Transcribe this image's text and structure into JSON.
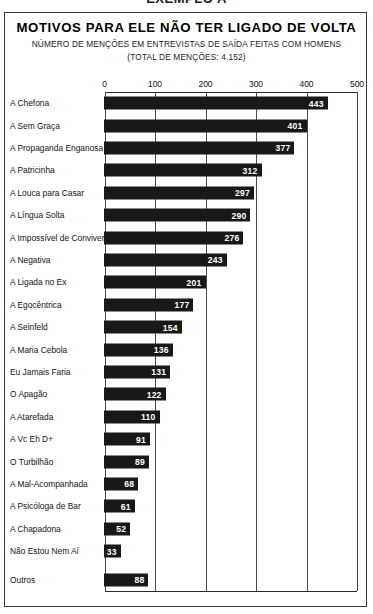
{
  "header": {
    "caption": "EXEMPLO A"
  },
  "chart_data": {
    "type": "bar",
    "orientation": "horizontal",
    "title": "MOTIVOS PARA ELE NÃO TER LIGADO DE VOLTA",
    "subtitle": "NÚMERO DE MENÇÕES EM ENTREVISTAS DE SAÍDA FEITAS COM HOMENS",
    "subtitle2": "(TOTAL DE MENÇÕES: 4.152)",
    "xlabel": "",
    "ylabel": "",
    "xlim": [
      0,
      500
    ],
    "xticks": [
      0,
      100,
      200,
      300,
      400,
      500
    ],
    "xtick_labels": [
      "0",
      "100",
      "200",
      "300",
      "400",
      "500"
    ],
    "grid": true,
    "grid_axis": "x",
    "legend": false,
    "bar_color": "#181818",
    "value_label_color": "#ffffff",
    "total": 4152,
    "categories": [
      "A Chefona",
      "A Sem Graça",
      "A Propaganda Enganosa",
      "A Patricinha",
      "A Louca para Casar",
      "A Língua Solta",
      "A Impossível de Conviver",
      "A Negativa",
      "A Ligada no Ex",
      "A Egocêntrica",
      "A Seinfeld",
      "A Maria Cebola",
      "Eu Jamais Faria",
      "O Apagão",
      "A Atarefada",
      "A Vc Eh D+",
      "O Turbilhão",
      "A Mal-Acompanhada",
      "A Psicóloga de Bar",
      "A Chapadona",
      "Não Estou Nem Aí",
      "Outros"
    ],
    "values": [
      443,
      401,
      377,
      312,
      297,
      290,
      276,
      243,
      201,
      177,
      154,
      136,
      131,
      122,
      110,
      91,
      89,
      68,
      61,
      52,
      33,
      88
    ],
    "separated_last_category": true
  }
}
